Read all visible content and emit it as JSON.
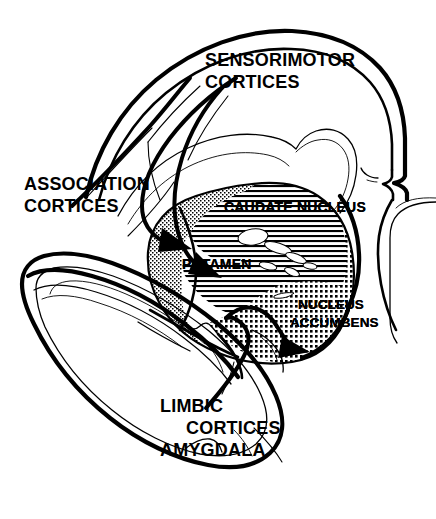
{
  "figure": {
    "name": "corticostriatal-projection-diagram",
    "type": "anatomical-schematic",
    "background_color": "#ffffff",
    "ink_color": "#000000",
    "width": 436,
    "height": 519
  },
  "cortical_labels": [
    {
      "id": "sensorimotor",
      "lines": [
        "SENSORIMOTOR",
        "CORTICES"
      ],
      "line1": "SENSORIMOTOR",
      "line2": "CORTICES",
      "x": 205,
      "y": 66,
      "align": "start"
    },
    {
      "id": "association",
      "lines": [
        "ASSOCIATION",
        "CORTICES"
      ],
      "line1": "ASSOCIATION",
      "line2": "CORTICES",
      "x": 24,
      "y": 190,
      "align": "start"
    },
    {
      "id": "limbic",
      "lines": [
        "LIMBIC",
        "CORTICES",
        "AMYGDALA"
      ],
      "line1": "LIMBIC",
      "line2": "CORTICES",
      "line3": "AMYGDALA",
      "x": 160,
      "y": 412,
      "align": "start"
    }
  ],
  "striatal_labels": [
    {
      "id": "caudate",
      "text": "CAUDATE  NUCLEUS",
      "x": 224,
      "y": 212,
      "texture": "horizontal-lines",
      "territory": "association"
    },
    {
      "id": "putamen",
      "text": "PUTAMEN",
      "x": 182,
      "y": 269,
      "texture": "fine-stipple",
      "territory": "sensorimotor"
    },
    {
      "id": "accumbens",
      "line1": "NUCLEUS",
      "line2": "ACCUMBENS",
      "text": "NUCLEUS ACCUMBENS",
      "x": 298,
      "y": 309,
      "texture": "coarse-grid-dots",
      "territory": "limbic"
    }
  ],
  "textures": {
    "sensorimotor_fill": "fine-stipple",
    "association_fill": "horizontal-lines",
    "limbic_fill": "coarse-grid-dots"
  },
  "projections": [
    {
      "id": "sensorimotor-to-putamen",
      "from": "SENSORIMOTOR CORTICES",
      "to": "PUTAMEN",
      "style": "thick-curved-arrow"
    },
    {
      "id": "association-to-caudate",
      "from": "ASSOCIATION CORTICES",
      "to": "CAUDATE NUCLEUS",
      "style": "thick-curved-arrow"
    },
    {
      "id": "limbic-to-accumbens",
      "from": "LIMBIC CORTICES AMYGDALA",
      "to": "NUCLEUS ACCUMBENS",
      "style": "thick-curved-arrow"
    }
  ]
}
